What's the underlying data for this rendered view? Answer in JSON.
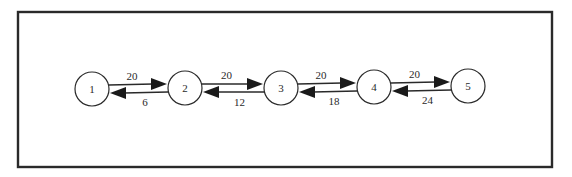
{
  "diagram": {
    "type": "bidirectional chain graph",
    "frame": {
      "x": 18,
      "y": 12,
      "width": 534,
      "height": 155
    },
    "nodes": [
      {
        "id": "1",
        "label": "1",
        "cx": 92,
        "cy": 89,
        "r": 17
      },
      {
        "id": "2",
        "label": "2",
        "cx": 185,
        "cy": 88,
        "r": 17
      },
      {
        "id": "3",
        "label": "3",
        "cx": 281,
        "cy": 88,
        "r": 17
      },
      {
        "id": "4",
        "label": "4",
        "cx": 374,
        "cy": 87,
        "r": 17
      },
      {
        "id": "5",
        "label": "5",
        "cx": 468,
        "cy": 86,
        "r": 17
      }
    ],
    "edges_forward": [
      {
        "from": "1",
        "to": "2",
        "label": "20"
      },
      {
        "from": "2",
        "to": "3",
        "label": "20"
      },
      {
        "from": "3",
        "to": "4",
        "label": "20"
      },
      {
        "from": "4",
        "to": "5",
        "label": "20"
      }
    ],
    "edges_backward": [
      {
        "from": "2",
        "to": "1",
        "label": "6"
      },
      {
        "from": "3",
        "to": "2",
        "label": "12"
      },
      {
        "from": "4",
        "to": "3",
        "label": "18"
      },
      {
        "from": "5",
        "to": "4",
        "label": "24"
      }
    ]
  },
  "colors": {
    "stroke": "#2a2a2a",
    "arrow_fill": "#1a1a1a",
    "background": "#ffffff"
  }
}
